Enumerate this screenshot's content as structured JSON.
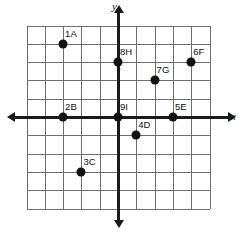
{
  "chart_data": {
    "type": "scatter",
    "title": "",
    "xlabel": "x",
    "ylabel": "y",
    "grid": true,
    "legend": "none",
    "xlim": [
      -5,
      5
    ],
    "ylim": [
      -5,
      5
    ],
    "grid_step": 1,
    "tick_labels_shown": false,
    "points": [
      {
        "label": "1A",
        "x": -3,
        "y": 4
      },
      {
        "label": "2B",
        "x": -3,
        "y": 0
      },
      {
        "label": "3C",
        "x": -2,
        "y": -3
      },
      {
        "label": "4D",
        "x": 1,
        "y": -1
      },
      {
        "label": "5E",
        "x": 3,
        "y": 0
      },
      {
        "label": "6F",
        "x": 4,
        "y": 3
      },
      {
        "label": "7G",
        "x": 2,
        "y": 2
      },
      {
        "label": "8H",
        "x": 0,
        "y": 3
      },
      {
        "label": "9I",
        "x": 0,
        "y": 0
      }
    ]
  },
  "axes": {
    "x_axis_label": "x",
    "y_axis_label": "y"
  },
  "colors": {
    "point": "#111111",
    "grid": "#6e6e6e",
    "axis": "#1a1a1a",
    "background": "#ffffff"
  }
}
